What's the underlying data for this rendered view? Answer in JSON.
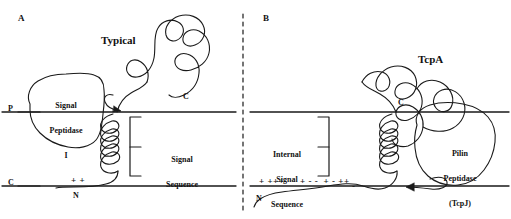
{
  "figure": {
    "type": "scientific-diagram",
    "width": 511,
    "height": 219,
    "stroke_color": "#1a1a1a",
    "text_color": "#111111",
    "background": "#ffffff"
  },
  "panels": {
    "a": {
      "letter": "A",
      "protein_label": "Typical",
      "enzyme_label": "Signal\nPeptidase\nI",
      "enzyme_line1": "Signal",
      "enzyme_line2": "Peptidase",
      "enzyme_line3": "I",
      "bracket_label": "Signal\nSequence",
      "bracket_line1": "Signal",
      "bracket_line2": "Sequence",
      "periplasm_label": "P",
      "cytoplasm_label": "C",
      "n_terminus": "N",
      "c_terminus": "C",
      "charges": "+ +"
    },
    "b": {
      "letter": "B",
      "protein_label": "TcpA",
      "enzyme_label": "Pilin\nPeptidase\n(TcpJ)",
      "enzyme_line1": "Pilin",
      "enzyme_line2": "Peptidase",
      "enzyme_line3": "(TcpJ)",
      "bracket_label": "Internal\nSignal\nSequence",
      "bracket_line1": "Internal",
      "bracket_line2": "Signal",
      "bracket_line3": "Sequence",
      "n_terminus": "N",
      "c_terminus": "C",
      "charges_group1": "+ +++",
      "charges_group2": "+ - -  + - ++",
      "charge_trailing": "-"
    }
  },
  "divider": {
    "style": "dashed-vertical"
  }
}
